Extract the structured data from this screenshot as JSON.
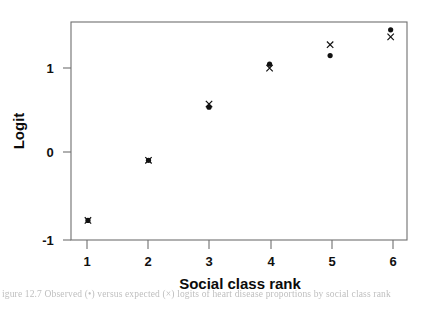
{
  "chart_data": {
    "type": "scatter",
    "title": "",
    "xlabel": "Social class rank",
    "ylabel": "Logit",
    "x": [
      1,
      2,
      3,
      4,
      5,
      6
    ],
    "categories": [
      "1",
      "2",
      "3",
      "4",
      "5",
      "6"
    ],
    "xlim": [
      0.72,
      6.27
    ],
    "ylim": [
      -1.17,
      1.62
    ],
    "grid": false,
    "legend": "none",
    "xticks": [
      1,
      2,
      3,
      4,
      5,
      6
    ],
    "xtick_labels": [
      "1",
      "2",
      "3",
      "4",
      "5",
      "6"
    ],
    "yticks": [
      -1,
      0,
      1
    ],
    "ytick_labels": [
      "-1",
      "0",
      "1"
    ],
    "series": [
      {
        "name": "observed",
        "marker": "filled-circle",
        "color": "#111111",
        "values": [
          -0.92,
          -0.15,
          0.53,
          1.08,
          1.19,
          1.52
        ]
      },
      {
        "name": "fitted",
        "marker": "cross",
        "color": "#111111",
        "values": [
          -0.92,
          -0.15,
          0.57,
          1.03,
          1.33,
          1.43
        ]
      }
    ]
  },
  "axes": {
    "x_title": "Social class rank",
    "y_title": "Logit"
  },
  "caption": {
    "text": "igure  12.7   Observed (•) versus expected (×) logits of heart disease proportions by social class rank"
  },
  "colors": {
    "axis": "#6f6f6f",
    "marker": "#111111",
    "background": "#ffffff"
  }
}
